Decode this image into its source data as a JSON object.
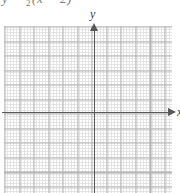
{
  "figure": {
    "kind": "blank-cartesian-coordinate-grid",
    "caption_partial": "y = ½(x − 2)",
    "caption_clipped": true
  },
  "axes": {
    "y_label": "y",
    "x_label": "x",
    "x_axis_name": "x-axis",
    "y_axis_name": "y-axis",
    "x_arrow_direction": "right",
    "y_arrow_direction": "up"
  },
  "colors": {
    "background": "#ffffff",
    "minor_grid": "#cfcfcf",
    "major_grid": "#b4b4b4",
    "axis": "#585858",
    "label_text": "#3c3c3c",
    "caption_text": "#7a7a7a"
  },
  "chart_data": {
    "type": "line",
    "title": "",
    "subtitle": "",
    "xlabel": "x",
    "ylabel": "y",
    "xlim": [
      -6.5,
      5.5
    ],
    "ylim": [
      -5.5,
      6.0
    ],
    "x_major_step": 1,
    "y_major_step": 1,
    "minor_subdivisions": 5,
    "grid": true,
    "legend": null,
    "annotations": [],
    "series": [
      {
        "name": "empty-plot",
        "x": [],
        "values": []
      }
    ],
    "note": "Blank graph-paper grid with labelled x and y axes and arrowheads; no data plotted."
  }
}
